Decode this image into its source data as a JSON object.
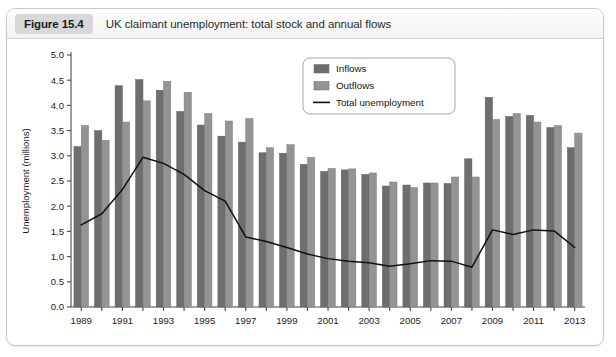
{
  "figure": {
    "badge": "Figure 15.4",
    "caption": "UK claimant unemployment: total stock and annual flows"
  },
  "legend": {
    "position": "top-center-right",
    "items": [
      {
        "label": "Inflows",
        "marker": "square",
        "color": "#6e6e6e"
      },
      {
        "label": "Outflows",
        "marker": "square",
        "color": "#949494"
      },
      {
        "label": "Total unemployment",
        "marker": "line",
        "color": "#101010"
      }
    ]
  },
  "chart_data": {
    "type": "bar",
    "title": "UK claimant unemployment: total stock and annual flows",
    "xlabel": "",
    "ylabel": "Unemployment (millions)",
    "ylim": [
      0.0,
      5.0
    ],
    "ytick_step": 0.5,
    "yticks": [
      "0.0",
      "0.5",
      "1.0",
      "1.5",
      "2.0",
      "2.5",
      "3.0",
      "3.5",
      "4.0",
      "4.5",
      "5.0"
    ],
    "grid": false,
    "legend_position": "upper center",
    "x": [
      1989,
      1990,
      1991,
      1992,
      1993,
      1994,
      1995,
      1996,
      1997,
      1998,
      1999,
      2000,
      2001,
      2002,
      2003,
      2004,
      2005,
      2006,
      2007,
      2008,
      2009,
      2010,
      2011,
      2012,
      2013
    ],
    "xtick_labels": [
      "1989",
      "",
      "1991",
      "",
      "1993",
      "",
      "1995",
      "",
      "1997",
      "",
      "1999",
      "",
      "2001",
      "",
      "2003",
      "",
      "2005",
      "",
      "2007",
      "",
      "2009",
      "",
      "2011",
      "",
      "2013"
    ],
    "xtick_label_every": 2,
    "series": [
      {
        "name": "Inflows",
        "kind": "bar",
        "color": "#6e6e6e",
        "values": [
          3.18,
          3.5,
          4.39,
          4.51,
          4.3,
          3.88,
          3.61,
          3.39,
          3.27,
          3.06,
          3.05,
          2.83,
          2.69,
          2.72,
          2.63,
          2.4,
          2.42,
          2.46,
          2.45,
          2.94,
          4.16,
          3.78,
          3.8,
          3.56,
          3.16
        ]
      },
      {
        "name": "Outflows",
        "kind": "bar",
        "color": "#949494",
        "values": [
          3.6,
          3.31,
          3.67,
          4.09,
          4.48,
          4.26,
          3.84,
          3.69,
          3.74,
          3.16,
          3.22,
          2.97,
          2.75,
          2.74,
          2.66,
          2.48,
          2.37,
          2.46,
          2.58,
          2.58,
          3.72,
          3.84,
          3.67,
          3.6,
          3.45
        ]
      },
      {
        "name": "Total unemployment",
        "kind": "line",
        "color": "#101010",
        "values": [
          1.63,
          1.85,
          2.33,
          2.97,
          2.85,
          2.63,
          2.31,
          2.1,
          1.39,
          1.3,
          1.18,
          1.05,
          0.96,
          0.91,
          0.88,
          0.81,
          0.86,
          0.92,
          0.91,
          0.79,
          1.53,
          1.44,
          1.53,
          1.51,
          1.18
        ]
      }
    ]
  }
}
